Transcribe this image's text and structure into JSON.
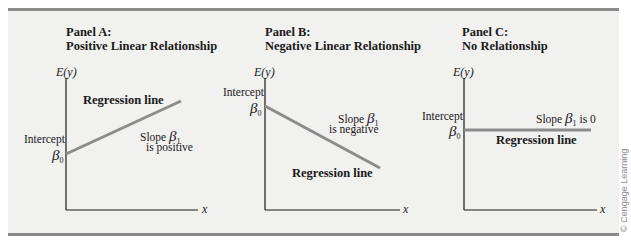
{
  "figure": {
    "background_color": "#f1f1f0",
    "rule_color": "#8a8a8a",
    "line_color": "#8c8c8c",
    "axis_color": "#1a1a1a",
    "watermark": "© Cengage Learning"
  },
  "panels": [
    {
      "id": "A",
      "title_line1": "Panel A:",
      "title_line2": "Positive Linear Relationship",
      "y_axis_label": "E(y)",
      "x_axis_label": "x",
      "intercept_label": "Intercept",
      "intercept_symbol": "β",
      "intercept_sub": "0",
      "regression_label": "Regression line",
      "slope_prefix": "Slope ",
      "slope_symbol": "β",
      "slope_sub": "1",
      "slope_suffix": "",
      "slope_line2": "is positive"
    },
    {
      "id": "B",
      "title_line1": "Panel B:",
      "title_line2": "Negative Linear Relationship",
      "y_axis_label": "E(y)",
      "x_axis_label": "x",
      "intercept_label": "Intercept",
      "intercept_symbol": "β",
      "intercept_sub": "0",
      "regression_label": "Regression line",
      "slope_prefix": "Slope ",
      "slope_symbol": "β",
      "slope_sub": "1",
      "slope_suffix": "",
      "slope_line2": "is negative"
    },
    {
      "id": "C",
      "title_line1": "Panel C:",
      "title_line2": "No Relationship",
      "y_axis_label": "E(y)",
      "x_axis_label": "x",
      "intercept_label": "Intercept",
      "intercept_symbol": "β",
      "intercept_sub": "0",
      "regression_label": "Regression line",
      "slope_prefix": "Slope ",
      "slope_symbol": "β",
      "slope_sub": "1",
      "slope_suffix": " is 0",
      "slope_line2": ""
    }
  ]
}
